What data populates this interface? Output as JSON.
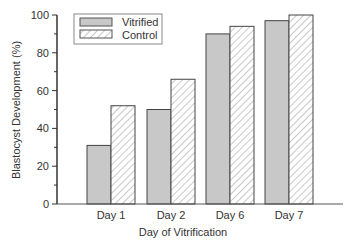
{
  "chart_data": {
    "type": "bar",
    "title": "",
    "xlabel": "Day of Vitrification",
    "ylabel": "Blastocyst Development  (%)",
    "ylim": [
      0,
      100
    ],
    "yticks": [
      0,
      20,
      40,
      60,
      80,
      100
    ],
    "categories": [
      "Day 1",
      "Day 2",
      "Day 6",
      "Day 7"
    ],
    "series": [
      {
        "name": "Vitrified",
        "values": [
          31,
          50,
          90,
          97
        ],
        "fill": "#c8c8c8",
        "pattern": "solid"
      },
      {
        "name": "Control",
        "values": [
          52,
          66,
          94,
          100
        ],
        "fill": "#ffffff",
        "pattern": "diagonal-hatch"
      }
    ],
    "legend_position": "upper-left",
    "grid": false
  },
  "legend": {
    "items": [
      {
        "label": "Vitrified"
      },
      {
        "label": "Control"
      }
    ]
  },
  "axes": {
    "y_ticks": [
      "0",
      "20",
      "40",
      "60",
      "80",
      "100"
    ],
    "x_ticks": [
      "Day 1",
      "Day 2",
      "Day 6",
      "Day 7"
    ],
    "xlabel": "Day of Vitrification",
    "ylabel": "Blastocyst Development  (%)"
  }
}
